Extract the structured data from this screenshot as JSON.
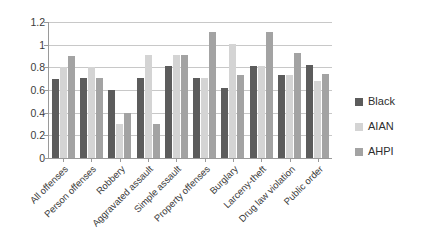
{
  "chart_data": {
    "type": "bar",
    "title": "",
    "xlabel": "",
    "ylabel": "",
    "ylim": [
      0,
      1.2
    ],
    "grid": true,
    "legend_position": "right",
    "categories": [
      "All offenses",
      "Person offenses",
      "Robbery",
      "Aggravated assault",
      "Simple assault",
      "Property offenses",
      "Burglary",
      "Larceny-theft",
      "Drug law violation",
      "Public order"
    ],
    "yticks": [
      "0",
      "0.2",
      "0.4",
      "0.6",
      "0.8",
      "1",
      "1.2"
    ],
    "ytick_values": [
      0,
      0.2,
      0.4,
      0.6,
      0.8,
      1,
      1.2
    ],
    "series": [
      {
        "name": "Black",
        "color": "#5c5c5c",
        "values": [
          0.7,
          0.71,
          0.6,
          0.71,
          0.81,
          0.71,
          0.62,
          0.81,
          0.73,
          0.82
        ]
      },
      {
        "name": "AIAN",
        "color": "#d4d4d4",
        "values": [
          0.8,
          0.8,
          0.3,
          0.91,
          0.91,
          0.71,
          1.01,
          0.81,
          0.73,
          0.68
        ]
      },
      {
        "name": "AHPI",
        "color": "#a3a3a3",
        "values": [
          0.9,
          0.71,
          0.4,
          0.3,
          0.91,
          1.11,
          0.73,
          1.11,
          0.93,
          0.74
        ]
      }
    ]
  }
}
